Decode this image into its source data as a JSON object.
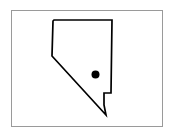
{
  "figure": {
    "type": "outline-map",
    "region_name": "Nevada",
    "caption": "",
    "background_color": "#ffffff",
    "frame": {
      "visible": true,
      "color": "#9a9a9a",
      "x": 11,
      "y": 10,
      "width": 152,
      "height": 117
    }
  },
  "map_data": {
    "outline": {
      "name": "Nevada state boundary",
      "stroke_color": "#000000",
      "fill_color": "#ffffff",
      "stroke_width": 1.7,
      "points": "54,20 112,20 111,93 104,93 104,105 106,115 52,56 53,21"
    },
    "markers": [
      {
        "name": "city-marker",
        "label": "",
        "shape": "circle",
        "color": "#000000",
        "x": 95.5,
        "y": 74.5,
        "radius": 4.0
      }
    ]
  }
}
